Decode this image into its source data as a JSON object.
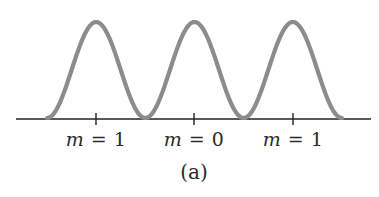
{
  "figure": {
    "caption": "(a)",
    "curve_color": "#8c8c8c",
    "axis_color": "#222222",
    "labels": [
      {
        "var": "m",
        "eq": " = 1",
        "x": 96
      },
      {
        "var": "m",
        "eq": " = 0",
        "x": 194
      },
      {
        "var": "m",
        "eq": " = 1",
        "x": 293
      }
    ]
  },
  "chart_data": {
    "type": "line",
    "title": "",
    "xlabel": "",
    "ylabel": "",
    "tick_labels": [
      "m = 1",
      "m = 0",
      "m = 1"
    ],
    "peaks": [
      {
        "label": "m = 1",
        "relative_intensity": 1.0
      },
      {
        "label": "m = 0",
        "relative_intensity": 1.0
      },
      {
        "label": "m = 1",
        "relative_intensity": 1.0
      }
    ],
    "grid": false,
    "legend": null,
    "annotation": "(a)"
  }
}
